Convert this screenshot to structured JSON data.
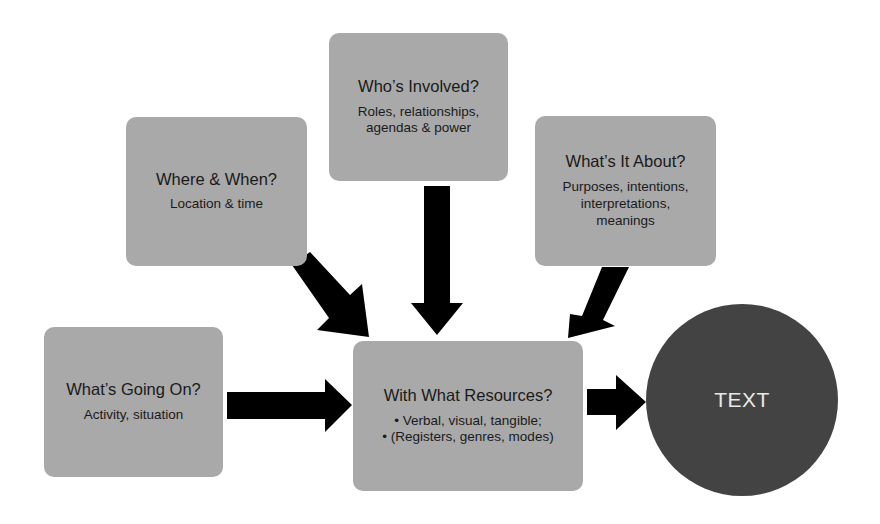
{
  "diagram": {
    "boxes": {
      "who": {
        "title": "Who’s Involved?",
        "sub": "Roles, relationships,\nagendas & power"
      },
      "where": {
        "title": "Where & When?",
        "sub": "Location & time"
      },
      "what_about": {
        "title": "What’s It About?",
        "sub": "Purposes, intentions,\ninterpretations,\nmeanings"
      },
      "going_on": {
        "title": "What’s Going On?",
        "sub": "Activity, situation"
      },
      "resources": {
        "title": "With What Resources?",
        "sub": "• Verbal, visual, tangible;\n• (Registers, genres, modes)"
      }
    },
    "center": {
      "label": "TEXT"
    },
    "colors": {
      "box": "#a9a9a9",
      "circle": "#434343",
      "arrow": "#000000",
      "circle_text": "#e8e8e8"
    },
    "arrows": [
      {
        "from": "who",
        "to": "resources"
      },
      {
        "from": "where",
        "to": "resources"
      },
      {
        "from": "what_about",
        "to": "resources"
      },
      {
        "from": "going_on",
        "to": "resources"
      },
      {
        "from": "resources",
        "to": "text"
      }
    ]
  }
}
